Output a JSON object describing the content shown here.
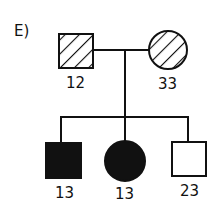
{
  "panel_label": "E)",
  "pedigree": {
    "parents": [
      {
        "sex": "male",
        "shape": "square",
        "fill": "hatched",
        "label": "12"
      },
      {
        "sex": "female",
        "shape": "circle",
        "fill": "hatched",
        "label": "33"
      }
    ],
    "children": [
      {
        "sex": "male",
        "shape": "square",
        "fill": "solid",
        "label": "13"
      },
      {
        "sex": "female",
        "shape": "circle",
        "fill": "solid",
        "label": "13"
      },
      {
        "sex": "male",
        "shape": "square",
        "fill": "empty",
        "label": "23"
      }
    ]
  },
  "colors": {
    "ink": "#111111",
    "background": "#ffffff"
  }
}
